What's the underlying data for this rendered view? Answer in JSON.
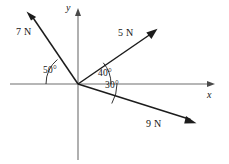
{
  "figure": {
    "background_color": "#ffffff",
    "axis_color": "#6f6f6f",
    "vector_color": "#1c1c1c",
    "origin": {
      "x": 78,
      "y": 84
    }
  },
  "axes": {
    "x": {
      "label": "x",
      "label_position": {
        "x": 207,
        "y": 90
      },
      "start": {
        "x": 10,
        "y": 84
      },
      "end": {
        "x": 215,
        "y": 84
      },
      "arrow": "right"
    },
    "y": {
      "label": "y",
      "label_position": {
        "x": 66,
        "y": 3
      },
      "start": {
        "x": 78,
        "y": 160
      },
      "end": {
        "x": 78,
        "y": 9
      },
      "arrow": "up"
    }
  },
  "vectors": [
    {
      "label": "7 N",
      "magnitude": 7,
      "unit": "N",
      "angle_deg": 130,
      "angle_from": "positive-x-axis",
      "tip": {
        "x": 27,
        "y": 12
      },
      "label_position": {
        "x": 16,
        "y": 27
      }
    },
    {
      "label": "5 N",
      "magnitude": 5,
      "unit": "N",
      "angle_deg": 40,
      "angle_from": "positive-x-axis",
      "tip": {
        "x": 157,
        "y": 29
      },
      "label_position": {
        "x": 118,
        "y": 28
      }
    },
    {
      "label": "9 N",
      "magnitude": 9,
      "unit": "N",
      "angle_deg": -30,
      "angle_from": "positive-x-axis",
      "tip": {
        "x": 196,
        "y": 123
      },
      "label_position": {
        "x": 146,
        "y": 119
      }
    }
  ],
  "angles": [
    {
      "value": "50",
      "degree_symbol": "o",
      "full_label": "50°",
      "between": "negative-x-axis and 7 N",
      "radius": 32,
      "start_deg": 180,
      "end_deg": 130,
      "label_position": {
        "x": 43,
        "y": 66
      }
    },
    {
      "value": "40",
      "degree_symbol": "o",
      "full_label": "40°",
      "between": "positive-x-axis and 5 N",
      "radius": 33,
      "start_deg": 40,
      "end_deg": 0,
      "label_position": {
        "x": 98,
        "y": 69
      }
    },
    {
      "value": "30",
      "degree_symbol": "o",
      "full_label": "30°",
      "between": "positive-x-axis and 9 N",
      "radius": 39,
      "start_deg": 0,
      "end_deg": -30,
      "label_position": {
        "x": 105,
        "y": 81
      }
    }
  ]
}
